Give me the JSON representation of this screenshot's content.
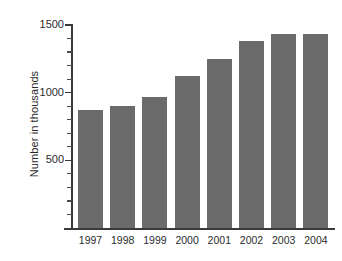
{
  "chart_data": {
    "type": "bar",
    "title": "",
    "xlabel": "",
    "ylabel": "Number in thousands",
    "categories": [
      "1997",
      "1998",
      "1999",
      "2000",
      "2001",
      "2002",
      "2003",
      "2004"
    ],
    "values": [
      870,
      900,
      970,
      1120,
      1250,
      1380,
      1430,
      1435
    ],
    "ylim": [
      0,
      1500
    ],
    "y_major_ticks": [
      500,
      1000,
      1500
    ],
    "y_major_tick_labels": [
      "500",
      "1000",
      "1500"
    ],
    "y_minor_tick_interval": 100,
    "grid": false,
    "legend": null,
    "bar_color": "#6b6b6b",
    "axis_color": "#3a3a3a",
    "text_color": "#2b2b2b",
    "background_color": "#ffffff"
  }
}
